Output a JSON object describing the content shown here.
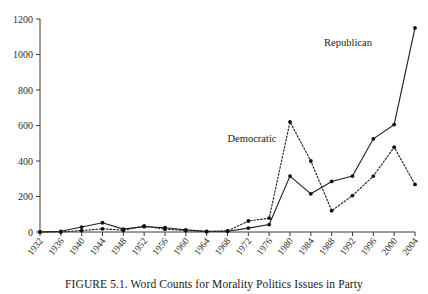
{
  "caption": "FIGURE 5.1.  Word Counts for Morality Politics Issues in Party",
  "series_labels": {
    "republican": "Republican",
    "democratic": "Democratic"
  },
  "chart_data": {
    "type": "line",
    "title": "FIGURE 5.1.  Word Counts for Morality Politics Issues in Party",
    "xlabel": "",
    "ylabel": "",
    "ylim": [
      0,
      1200
    ],
    "yticks": [
      0,
      200,
      400,
      600,
      800,
      1000,
      1200
    ],
    "ytick_labels": [
      "0",
      "200",
      "400",
      "600",
      "800",
      "1000",
      "1200"
    ],
    "grid": false,
    "legend_position": "inline-annotation",
    "categories": [
      1932,
      1936,
      1940,
      1944,
      1948,
      1952,
      1956,
      1960,
      1964,
      1968,
      1972,
      1976,
      1980,
      1984,
      1988,
      1992,
      1996,
      2000,
      2004
    ],
    "xtick_labels": [
      "1932",
      "1936",
      "1940",
      "1944",
      "1948",
      "1952",
      "1956",
      "1960",
      "1964",
      "1968",
      "1972",
      "1976",
      "1980",
      "1984",
      "1988",
      "1992",
      "1996",
      "2000",
      "2004"
    ],
    "series": [
      {
        "name": "Republican",
        "style": "solid",
        "marker": "filled-circle",
        "values": [
          0,
          4,
          28,
          52,
          16,
          30,
          24,
          12,
          4,
          4,
          22,
          42,
          315,
          215,
          285,
          315,
          525,
          605,
          1150
        ]
      },
      {
        "name": "Democratic",
        "style": "dotted",
        "marker": "filled-circle",
        "values": [
          0,
          0,
          8,
          18,
          10,
          34,
          16,
          8,
          2,
          6,
          62,
          78,
          620,
          400,
          120,
          205,
          315,
          478,
          268
        ]
      }
    ]
  }
}
